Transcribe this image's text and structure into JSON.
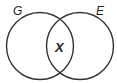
{
  "diagram": {
    "type": "venn",
    "sets": [
      {
        "name": "G",
        "label": "G"
      },
      {
        "name": "E",
        "label": "E"
      }
    ],
    "intersection": {
      "label": "X"
    },
    "colors": {
      "stroke": "#333333",
      "background": "#ffffff"
    }
  }
}
